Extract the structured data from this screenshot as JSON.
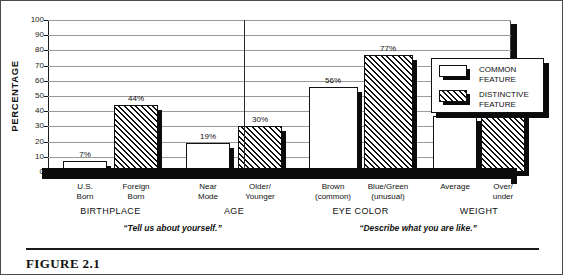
{
  "figure": {
    "caption": "FIGURE 2.1"
  },
  "chart_data": {
    "type": "bar",
    "title": "",
    "xlabel": "",
    "ylabel": "PERCENTAGE",
    "ylim": [
      0,
      100
    ],
    "ytick_step": 10,
    "yticks": [
      100,
      90,
      80,
      70,
      60,
      50,
      40,
      30,
      20,
      10,
      0
    ],
    "grid": true,
    "legend_position": "right",
    "categories": [
      "U.S.\nBorn",
      "Foreign\nBorn",
      "Near\nMode",
      "Older/\nYounger",
      "Brown\n(common)",
      "Blue/Green\n(unusual)",
      "Average",
      "Over/\nunder"
    ],
    "values": [
      7,
      44,
      19,
      30,
      56,
      77,
      37,
      52
    ],
    "value_labels": [
      "7%",
      "44%",
      "19%",
      "30%",
      "56%",
      "77%",
      "37%",
      "52%"
    ],
    "series": [
      {
        "name": "COMMON\nFEATURE",
        "fill": "solid-white",
        "values": [
          7,
          null,
          19,
          null,
          56,
          null,
          37,
          null
        ]
      },
      {
        "name": "DISTINCTIVE\nFEATURE",
        "fill": "hatched",
        "values": [
          null,
          44,
          null,
          30,
          null,
          77,
          null,
          52
        ]
      }
    ],
    "bars": [
      {
        "label": "U.S.\nBorn",
        "value": 7,
        "value_label": "7%",
        "fill": "solid-white",
        "group": "BIRTHPLACE"
      },
      {
        "label": "Foreign\nBorn",
        "value": 44,
        "value_label": "44%",
        "fill": "hatched",
        "group": "BIRTHPLACE"
      },
      {
        "label": "Near\nMode",
        "value": 19,
        "value_label": "19%",
        "fill": "solid-white",
        "group": "AGE"
      },
      {
        "label": "Older/\nYounger",
        "value": 30,
        "value_label": "30%",
        "fill": "hatched",
        "group": "AGE"
      },
      {
        "label": "Brown\n(common)",
        "value": 56,
        "value_label": "56%",
        "fill": "solid-white",
        "group": "EYE COLOR"
      },
      {
        "label": "Blue/Green\n(unusual)",
        "value": 77,
        "value_label": "77%",
        "fill": "hatched",
        "group": "EYE COLOR"
      },
      {
        "label": "Average",
        "value": 37,
        "value_label": "37%",
        "fill": "solid-white",
        "group": "WEIGHT"
      },
      {
        "label": "Over/\nunder",
        "value": 52,
        "value_label": "52%",
        "fill": "hatched",
        "group": "WEIGHT"
      }
    ],
    "groups": [
      {
        "label": "BIRTHPLACE"
      },
      {
        "label": "AGE"
      },
      {
        "label": "EYE COLOR"
      },
      {
        "label": "WEIGHT"
      }
    ],
    "annotations": [
      {
        "text": "“Tell us about yourself.”",
        "covers": [
          "BIRTHPLACE",
          "AGE"
        ]
      },
      {
        "text": "“Describe what you are like.”",
        "covers": [
          "EYE COLOR",
          "WEIGHT"
        ]
      }
    ],
    "legend": [
      {
        "label": "COMMON\nFEATURE",
        "fill": "solid-white"
      },
      {
        "label": "DISTINCTIVE\nFEATURE",
        "fill": "hatched"
      }
    ],
    "colors": {
      "bar_fill": "#ffffff",
      "bar_outline": "#111111",
      "hatch": "#111111",
      "shadow": "#0b0b0b",
      "gridline": "#9a9a9a",
      "text": "#111111"
    }
  }
}
